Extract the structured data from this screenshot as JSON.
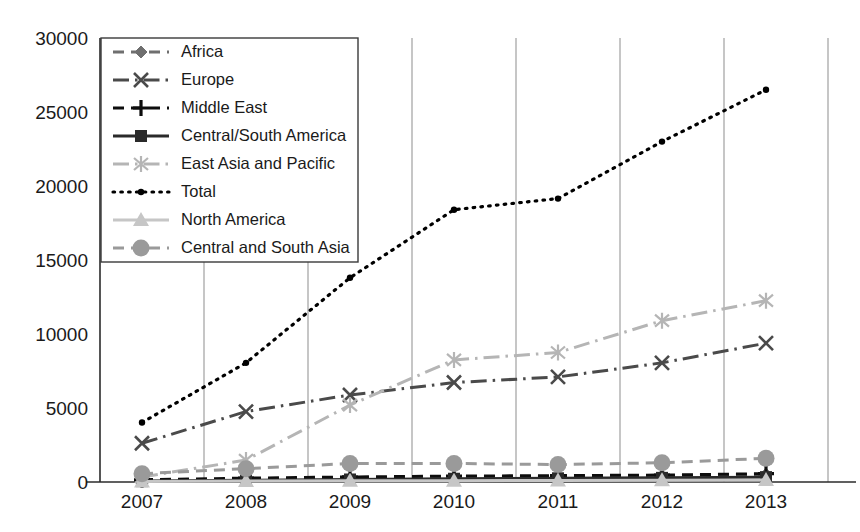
{
  "chart_data": {
    "type": "line",
    "title": "",
    "xlabel": "",
    "ylabel": "",
    "categories": [
      "2007",
      "2008",
      "2009",
      "2010",
      "2011",
      "2012",
      "2013"
    ],
    "x": [
      2007,
      2008,
      2009,
      2010,
      2011,
      2012,
      2013
    ],
    "ylim": [
      0,
      30000
    ],
    "yticks": [
      0,
      5000,
      10000,
      15000,
      20000,
      25000,
      30000
    ],
    "ytick_labels": [
      "0",
      "5000",
      "10000",
      "15000",
      "20000",
      "25000",
      "30000"
    ],
    "grid": "vertical-only",
    "legend_position": "upper-left-inside",
    "series": [
      {
        "name": "Africa",
        "marker": "diamond",
        "line_style": "dashed",
        "color": "#6f6f6f",
        "values": [
          100,
          180,
          260,
          330,
          380,
          430,
          520
        ]
      },
      {
        "name": "Europe",
        "marker": "x",
        "line_style": "dash-dot",
        "color": "#4a4a4a",
        "values": [
          2620,
          4760,
          5880,
          6720,
          7100,
          8050,
          9380
        ]
      },
      {
        "name": "Middle East",
        "marker": "plus",
        "line_style": "dashed",
        "color": "#0d0d0d",
        "values": [
          150,
          260,
          340,
          400,
          430,
          470,
          560
        ]
      },
      {
        "name": "Central/South America",
        "marker": "square",
        "line_style": "solid",
        "color": "#2a2a2a",
        "values": [
          60,
          110,
          170,
          220,
          250,
          280,
          330
        ]
      },
      {
        "name": "East Asia and Pacific",
        "marker": "asterisk",
        "line_style": "dash-dot",
        "color": "#b5b5b5",
        "values": [
          340,
          1480,
          5200,
          8250,
          8750,
          10900,
          12250
        ]
      },
      {
        "name": "Total",
        "marker": "dot",
        "line_style": "dotted",
        "color": "#000000",
        "values": [
          4020,
          8050,
          13800,
          18400,
          19150,
          23000,
          26500
        ]
      },
      {
        "name": "North America",
        "marker": "triangle",
        "line_style": "solid",
        "color": "#c6c6c6",
        "values": [
          40,
          60,
          80,
          90,
          100,
          110,
          130
        ]
      },
      {
        "name": "Central and South Asia",
        "marker": "circle",
        "line_style": "dashed",
        "color": "#9a9a9a",
        "values": [
          560,
          900,
          1250,
          1250,
          1180,
          1300,
          1600
        ]
      }
    ]
  }
}
